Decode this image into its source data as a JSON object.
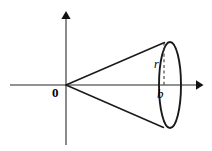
{
  "figure": {
    "type": "geometry-diagram",
    "canvas": {
      "width": 212,
      "height": 151,
      "background": "#ffffff"
    },
    "labels": {
      "origin": "0",
      "radius": "r",
      "base_position": "b"
    },
    "colors": {
      "axis": "#6e6e6e",
      "arrowhead": "#111111",
      "cone_outline": "#1a1a1a",
      "ellipse_outline": "#1a1a1a",
      "radius_dash": "#3a3a3a",
      "label_text": "#000000"
    },
    "geometry": {
      "origin": {
        "x": 66,
        "y": 85
      },
      "x_axis": {
        "x_start": 10,
        "x_end": 202,
        "y": 85,
        "arrow": "right"
      },
      "y_axis": {
        "x": 66,
        "y_start": 145,
        "y_end": 12,
        "arrow": "up"
      },
      "cone_apex": {
        "x": 66,
        "y": 85
      },
      "cone_upper_contact": {
        "x": 164,
        "y": 42
      },
      "cone_lower_contact": {
        "x": 163,
        "y": 127
      },
      "base_ellipse": {
        "center_x": 170,
        "center_y": 85,
        "radius_x": 11,
        "radius_y": 43
      },
      "radius_dash_line": {
        "x": 164,
        "y_top": 42,
        "y_bottom": 85
      }
    }
  }
}
